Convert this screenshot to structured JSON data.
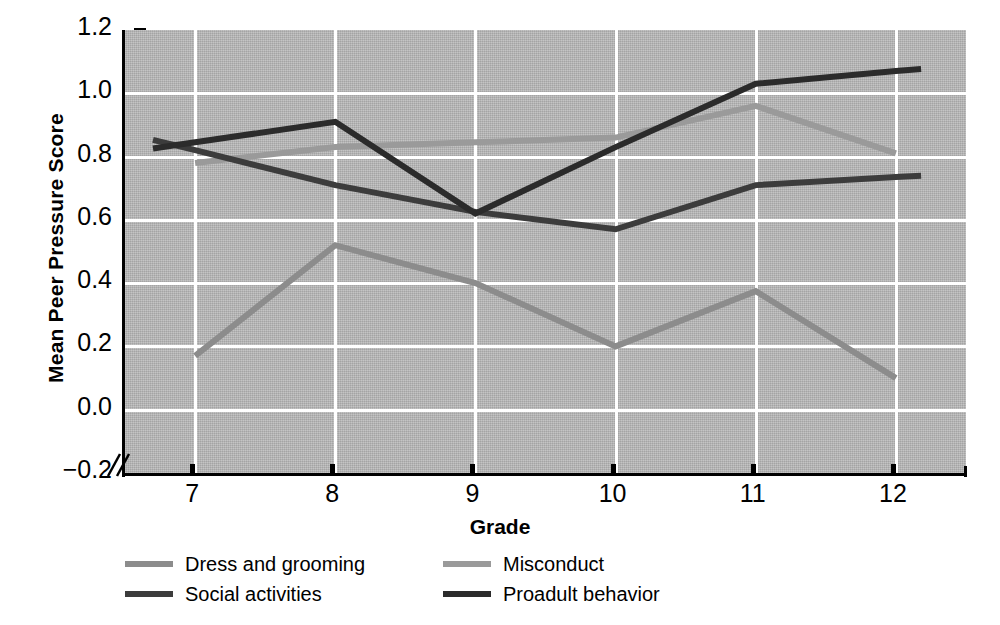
{
  "chart_data": {
    "type": "line",
    "title": "",
    "xlabel": "Grade",
    "ylabel": "Mean Peer Pressure Score",
    "categories": [
      7,
      8,
      9,
      10,
      11,
      12
    ],
    "xtick_labels": [
      "7",
      "8",
      "9",
      "10",
      "11",
      "12"
    ],
    "ytick_labels": [
      "1.2",
      "1.0",
      "0.8",
      "0.6",
      "0.4",
      "0.2",
      "0.0",
      "−0.2"
    ],
    "ytick_values": [
      1.2,
      1.0,
      0.8,
      0.6,
      0.4,
      0.2,
      0.0,
      -0.2
    ],
    "ylim": [
      -0.2,
      1.2
    ],
    "xlim": [
      6.5,
      12.5
    ],
    "grid": "horizontal-and-vertical-white",
    "axis_break": true,
    "legend_position": "below-plot",
    "series": [
      {
        "name": "Dress and grooming",
        "color": "#8c8c8c",
        "values": [
          0.17,
          0.52,
          0.4,
          0.2,
          0.375,
          0.1
        ]
      },
      {
        "name": "Misconduct",
        "color": "#9a9a9a",
        "values": [
          0.78,
          0.83,
          0.845,
          0.86,
          0.96,
          0.81
        ]
      },
      {
        "name": "Social activities",
        "color": "#3c3c3c",
        "values": [
          0.82,
          0.71,
          0.625,
          0.57,
          0.71,
          0.735
        ]
      },
      {
        "name": "Proadult behavior",
        "color": "#2b2b2b",
        "values": [
          0.845,
          0.91,
          0.62,
          0.83,
          1.03,
          1.07
        ]
      }
    ]
  },
  "legend": {
    "items": [
      {
        "label": "Dress and grooming",
        "color": "#8c8c8c"
      },
      {
        "label": "Misconduct",
        "color": "#9a9a9a"
      },
      {
        "label": "Social activities",
        "color": "#3c3c3c"
      },
      {
        "label": "Proadult behavior",
        "color": "#2b2b2b"
      }
    ]
  },
  "colors": {
    "plot_background": "#b6b6b6",
    "gridline": "#ffffff",
    "axis": "#000000",
    "page_background": "#ffffff"
  }
}
